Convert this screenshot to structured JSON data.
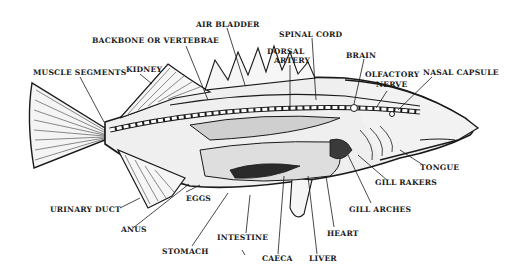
{
  "diagram": {
    "colors": {
      "ink": "#1a1a1a",
      "background": "#ffffff",
      "body_fill": "#efefef"
    },
    "labels": {
      "air_bladder": "AIR BLADDER",
      "backbone": "BACKBONE OR VERTEBRAE",
      "spinal_cord": "SPINAL CORD",
      "dorsal_artery_1": "DORSAL",
      "dorsal_artery_2": "ARTERY",
      "brain": "BRAIN",
      "muscle_segments": "MUSCLE SEGMENTS",
      "kidney": "KIDNEY",
      "olfactory_nerve_1": "OLFACTORY",
      "olfactory_nerve_2": "NERVE",
      "nasal_capsule": "NASAL CAPSULE",
      "tongue": "TONGUE",
      "gill_rakers": "GILL RAKERS",
      "gill_arches": "GILL ARCHES",
      "heart": "HEART",
      "liver": "LIVER",
      "caeca": "CAECA",
      "intestine": "INTESTINE",
      "stomach": "STOMACH",
      "anus": "ANUS",
      "eggs": "EGGS",
      "urinary_duct": "URINARY DUCT"
    }
  }
}
